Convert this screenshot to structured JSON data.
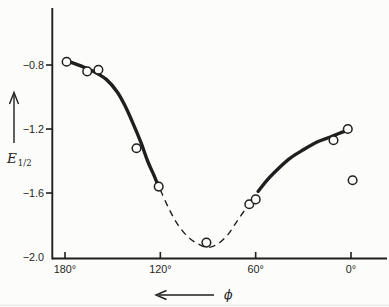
{
  "figure": {
    "background": "#fcfcfa",
    "ink": "#1f1f1f"
  },
  "chart_data": {
    "type": "scatter",
    "title": "",
    "xlabel": "ϕ",
    "ylabel": "E",
    "ylabel_sub": "1/2",
    "x_axis": {
      "direction": "reversed",
      "arrow": "left",
      "unit": "degrees",
      "ticks": [
        {
          "value": 180,
          "label": "180°"
        },
        {
          "value": 120,
          "label": "120°"
        },
        {
          "value": 60,
          "label": "60°"
        },
        {
          "value": 0,
          "label": "0°"
        }
      ]
    },
    "y_axis": {
      "arrow": "up",
      "ticks": [
        {
          "value": -0.8,
          "label": "−0.8",
          "dash": true
        },
        {
          "value": -1.2,
          "label": "−1.2",
          "dash": true
        },
        {
          "value": -1.6,
          "label": "−1.6",
          "dash": true
        },
        {
          "value": -2.0,
          "label": "−2.0",
          "dash": false
        }
      ]
    },
    "xlim": [
      180,
      -22
    ],
    "ylim": [
      -2.05,
      -0.44
    ],
    "points": [
      {
        "phi": 179,
        "e": -0.78
      },
      {
        "phi": 166,
        "e": -0.84
      },
      {
        "phi": 159,
        "e": -0.83
      },
      {
        "phi": 135,
        "e": -1.32
      },
      {
        "phi": 121,
        "e": -1.56
      },
      {
        "phi": 91,
        "e": -1.91
      },
      {
        "phi": 64,
        "e": -1.67
      },
      {
        "phi": 60,
        "e": -1.64
      },
      {
        "phi": 11,
        "e": -1.27
      },
      {
        "phi": 2,
        "e": -1.2
      },
      {
        "phi": -1,
        "e": -1.52
      }
    ],
    "curves": [
      {
        "style": "solid",
        "points": [
          [
            177,
            -0.78
          ],
          [
            169,
            -0.81
          ],
          [
            162,
            -0.84
          ],
          [
            154,
            -0.89
          ],
          [
            147,
            -0.97
          ],
          [
            142,
            -1.06
          ],
          [
            137,
            -1.17
          ],
          [
            132,
            -1.29
          ],
          [
            128,
            -1.4
          ],
          [
            124,
            -1.49
          ],
          [
            121,
            -1.56
          ]
        ]
      },
      {
        "style": "dashed",
        "points": [
          [
            120,
            -1.58
          ],
          [
            115,
            -1.69
          ],
          [
            109.5,
            -1.79
          ],
          [
            103,
            -1.87
          ],
          [
            96,
            -1.92
          ],
          [
            90,
            -1.94
          ],
          [
            84,
            -1.92
          ],
          [
            77.5,
            -1.86
          ],
          [
            72,
            -1.78
          ],
          [
            67,
            -1.71
          ],
          [
            64,
            -1.68
          ]
        ]
      },
      {
        "style": "solid",
        "points": [
          [
            58.5,
            -1.59
          ],
          [
            52,
            -1.51
          ],
          [
            45,
            -1.44
          ],
          [
            38,
            -1.38
          ],
          [
            30,
            -1.33
          ],
          [
            21,
            -1.28
          ],
          [
            13,
            -1.25
          ],
          [
            8,
            -1.23
          ],
          [
            3,
            -1.21
          ]
        ]
      }
    ]
  }
}
